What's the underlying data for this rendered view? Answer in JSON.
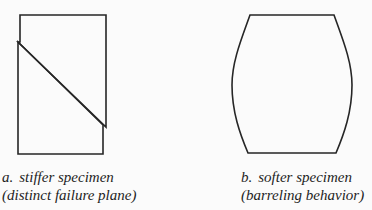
{
  "figure": {
    "panels": [
      {
        "id": "a",
        "shape": "rectangle-with-diagonal-failure-plane",
        "caption": {
          "prefix": "a.",
          "title": "stiffer specimen",
          "subtitle": "(distinct failure plane)"
        }
      },
      {
        "id": "b",
        "shape": "barrel",
        "caption": {
          "prefix": "b.",
          "title": "softer specimen",
          "subtitle": "(barreling behavior)"
        }
      }
    ],
    "colors": {
      "background": "#fbfbfb",
      "stroke": "#262626",
      "text": "#1e1e1e"
    }
  }
}
